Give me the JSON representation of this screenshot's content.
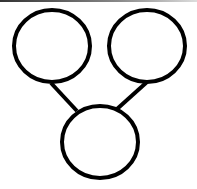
{
  "diagram": {
    "type": "node-link",
    "stroke_color": "#000000",
    "fill_color": "#ffffff",
    "nodes": [
      {
        "id": "left",
        "label": ""
      },
      {
        "id": "right",
        "label": ""
      },
      {
        "id": "bottom",
        "label": ""
      }
    ],
    "edges": [
      {
        "from": "left",
        "to": "bottom"
      },
      {
        "from": "right",
        "to": "bottom"
      }
    ]
  }
}
